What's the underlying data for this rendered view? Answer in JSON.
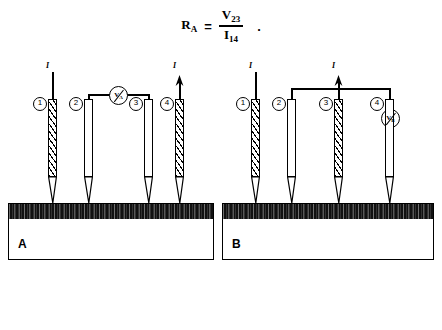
{
  "figure": {
    "formula": {
      "lhs_symbol": "R",
      "lhs_sub": "A",
      "equals": "=",
      "numerator_symbol": "V",
      "numerator_sub": "23",
      "denominator_symbol": "I",
      "denominator_sub": "14",
      "trailing_punctuation": "."
    },
    "panels": [
      {
        "id": "A",
        "label": "A",
        "current_labels": [
          "I",
          "I"
        ],
        "meter": {
          "symbol": "V",
          "sub": "A",
          "name": "voltmeter"
        },
        "probes": [
          {
            "number": "1",
            "style": "hatched",
            "role": "current-in"
          },
          {
            "number": "2",
            "style": "plain",
            "role": "voltage"
          },
          {
            "number": "3",
            "style": "plain",
            "role": "voltage"
          },
          {
            "number": "4",
            "style": "hatched",
            "role": "current-out"
          }
        ]
      },
      {
        "id": "B",
        "label": "B",
        "current_labels": [
          "I",
          "I"
        ],
        "meter": {
          "symbol": "V",
          "sub": "B",
          "name": "voltmeter"
        },
        "probes": [
          {
            "number": "1",
            "style": "hatched",
            "role": "current-in"
          },
          {
            "number": "2",
            "style": "plain",
            "role": "voltage"
          },
          {
            "number": "3",
            "style": "hatched",
            "role": "current-out"
          },
          {
            "number": "4",
            "style": "plain",
            "role": "voltage"
          }
        ]
      }
    ],
    "sample": {
      "film_name": "thin-film-layer",
      "substrate_name": "substrate-block"
    },
    "colors": {
      "ink": "#000000",
      "paper": "#ffffff",
      "film": "#111111"
    }
  }
}
